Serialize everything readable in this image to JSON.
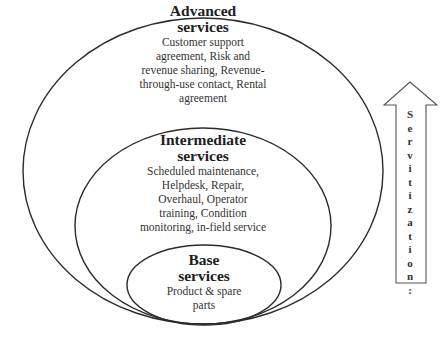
{
  "diagram": {
    "type": "nested-ellipses",
    "levels": [
      {
        "id": "advanced",
        "title_line1": "Advanced",
        "title_line2": "services",
        "desc_lines": [
          "Customer support",
          "agreement, Risk and",
          "revenue sharing, Revenue-",
          "through-use contact, Rental",
          "agreement"
        ]
      },
      {
        "id": "intermediate",
        "title_line1": "Intermediate",
        "title_line2": "services",
        "desc_lines": [
          "Scheduled maintenance,",
          "Helpdesk, Repair,",
          "Overhaul, Operator",
          "training, Condition",
          "monitoring, in-field service"
        ]
      },
      {
        "id": "base",
        "title_line1": "Base",
        "title_line2": "services",
        "desc_lines": [
          "Product & spare",
          "parts"
        ]
      }
    ],
    "arrow": {
      "label_chars": [
        "S",
        "e",
        "r",
        "v",
        "i",
        "t",
        "i",
        "z",
        "a",
        "t",
        "i",
        "o",
        "n",
        ":"
      ],
      "direction": "up"
    },
    "colors": {
      "stroke": "#2b2b2b",
      "background": "#ffffff"
    }
  }
}
